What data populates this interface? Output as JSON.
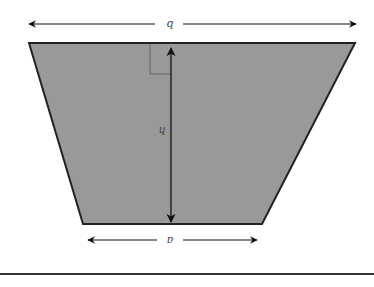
{
  "diagram": {
    "orientation": "rotated 180 degrees (labels appear upside-down)",
    "shape": "trapezoid",
    "labels": {
      "long_base": "b",
      "height": "h",
      "short_base": "a"
    },
    "right_angle_marker": true,
    "colors": {
      "fill": "#999999",
      "stroke": "#222222",
      "arrow": "#111111",
      "label": "#444444",
      "rule": "#333333"
    }
  }
}
